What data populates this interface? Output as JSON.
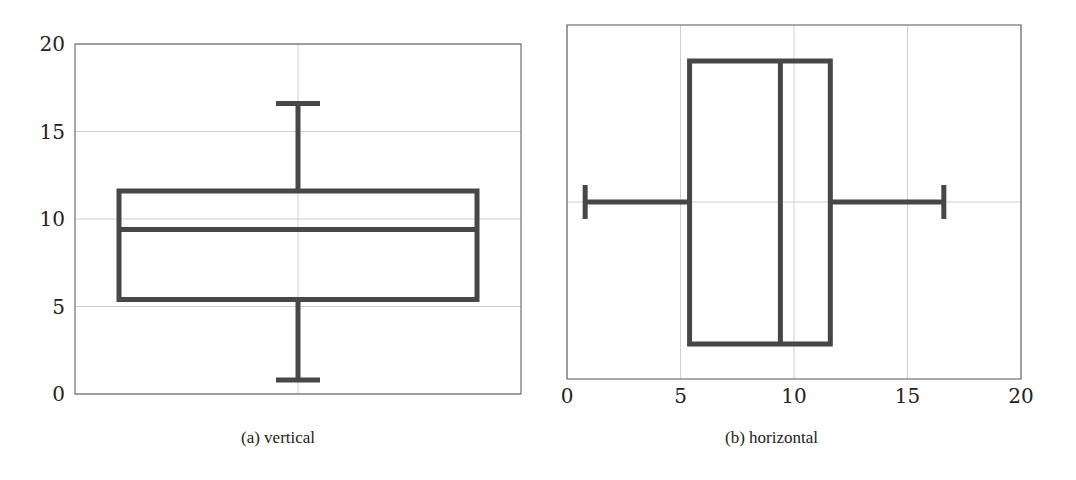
{
  "chart_data": [
    {
      "type": "box",
      "orientation": "vertical",
      "caption": "(a) vertical",
      "title": "",
      "xlabel": "",
      "ylabel": "",
      "ylim": [
        0,
        20
      ],
      "yticks": [
        "0",
        "5",
        "10",
        "15",
        "20"
      ],
      "grid": true,
      "box": {
        "min": 0.8,
        "q1": 5.4,
        "median": 9.4,
        "q3": 11.6,
        "max": 16.6
      }
    },
    {
      "type": "box",
      "orientation": "horizontal",
      "caption": "(b) horizontal",
      "title": "",
      "xlabel": "",
      "ylabel": "",
      "xlim": [
        0,
        20
      ],
      "xticks": [
        "0",
        "5",
        "10",
        "15",
        "20"
      ],
      "grid": true,
      "box": {
        "min": 0.8,
        "q1": 5.4,
        "median": 9.4,
        "q3": 11.6,
        "max": 16.6
      }
    }
  ],
  "style": {
    "box_color": "#474747",
    "grid_color": "#cfcfcf",
    "axis_color": "#555555"
  }
}
